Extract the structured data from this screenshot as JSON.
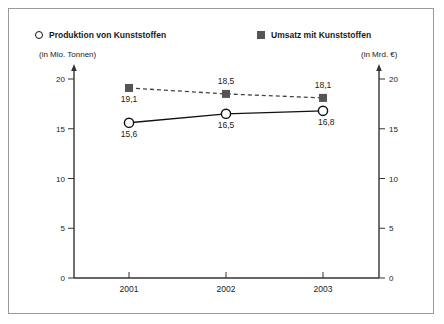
{
  "legend": {
    "left": {
      "marker": "circle-open-marker",
      "label": "Produktion von Kunststoffen",
      "units": "(in Mio. Tonnen)"
    },
    "right": {
      "marker": "square-filled-marker",
      "label": "Umsatz mit Kunststoffen",
      "units": "(in Mrd. €)"
    }
  },
  "colors": {
    "series_production": "#111111",
    "series_revenue": "#555555",
    "frame": "#9a9a9a",
    "axis": "#333333",
    "background": "#ffffff"
  },
  "chart_data": {
    "type": "line",
    "title": "",
    "subtitle": "",
    "categories": [
      "2001",
      "2002",
      "2003"
    ],
    "xlabel": "",
    "ylabel": "(in Mio. Tonnen)",
    "y2label": "(in Mrd. €)",
    "ylim": [
      0,
      20
    ],
    "y2lim": [
      0,
      20
    ],
    "yticks": [
      "20",
      "15",
      "10",
      "5",
      "0"
    ],
    "ytick_values": [
      20,
      15,
      10,
      5,
      0
    ],
    "y2ticks": [
      "20",
      "15",
      "10",
      "5",
      "0"
    ],
    "y2tick_values": [
      20,
      15,
      10,
      5,
      0
    ],
    "grid": false,
    "legend_position": "top",
    "series": [
      {
        "name": "Produktion von Kunststoffen",
        "axis": "left",
        "unit": "Mio. Tonnen",
        "line_style": "solid",
        "marker": "circle-open",
        "values": [
          15.6,
          16.5,
          16.8
        ],
        "value_labels": [
          "15,6",
          "16,5",
          "16,8"
        ],
        "label_positions": [
          "below",
          "below",
          "below-right"
        ]
      },
      {
        "name": "Umsatz mit Kunststoffen",
        "axis": "right",
        "unit": "Mrd. €",
        "line_style": "dashed",
        "marker": "square-filled",
        "values": [
          19.1,
          18.5,
          18.1
        ],
        "value_labels": [
          "19,1",
          "18,5",
          "18,1"
        ],
        "label_positions": [
          "below",
          "above",
          "above"
        ]
      }
    ]
  }
}
